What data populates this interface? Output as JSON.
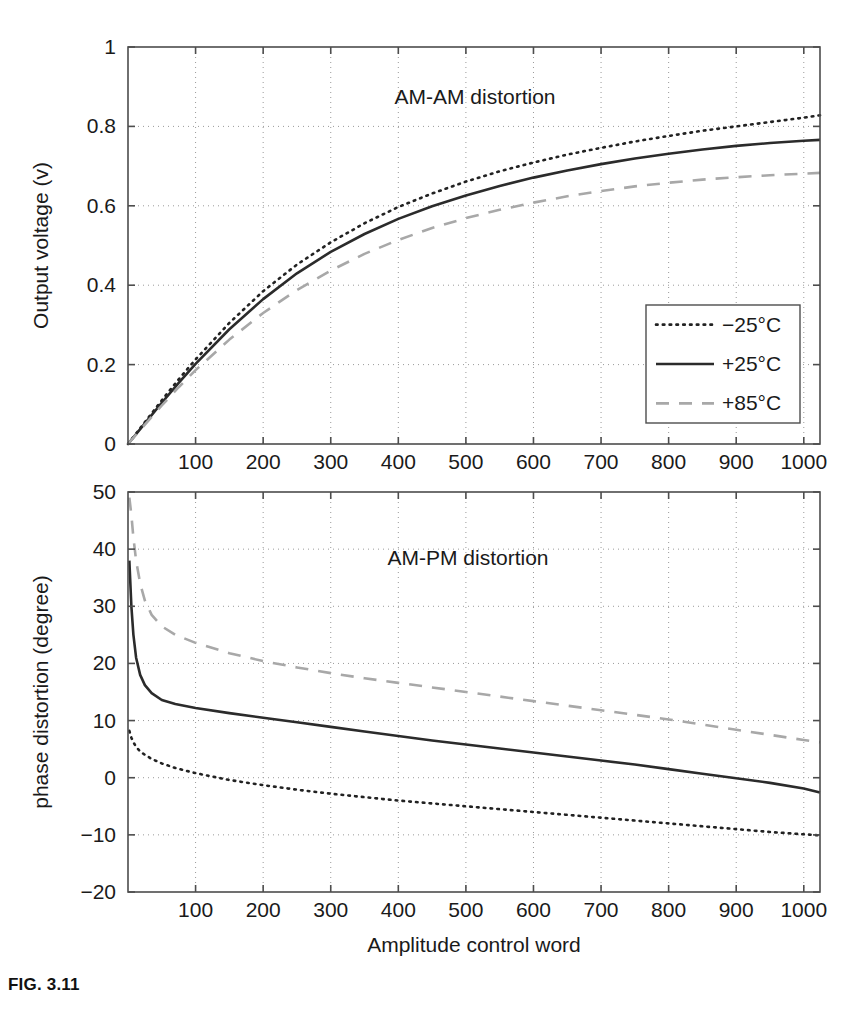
{
  "figure": {
    "caption": "FIG. 3.11",
    "width": 863,
    "height": 1019
  },
  "legend": {
    "entries": [
      {
        "label": "−25°C",
        "style": "dotted",
        "color": "#222222"
      },
      {
        "label": "+25°C",
        "style": "solid",
        "color": "#2b2b2b"
      },
      {
        "label": "+85°C",
        "style": "dashed",
        "color": "#a8a8a8"
      }
    ]
  },
  "chart_data": [
    {
      "id": "am-am",
      "type": "line",
      "title": "AM-AM distortion",
      "xlabel": "",
      "ylabel": "Output voltage (v)",
      "xlim": [
        0,
        1024
      ],
      "ylim": [
        0,
        1
      ],
      "xticks": [
        100,
        200,
        300,
        400,
        500,
        600,
        700,
        800,
        900,
        1000
      ],
      "yticks": [
        0,
        0.2,
        0.4,
        0.6,
        0.8,
        1
      ],
      "ytick_labels": [
        "0",
        "0.2",
        "0.4",
        "0.6",
        "0.8",
        "1"
      ],
      "xtick_labels": [
        "100",
        "200",
        "300",
        "400",
        "500",
        "600",
        "700",
        "800",
        "900",
        "1000"
      ],
      "grid": true,
      "legend_position": "lower-right",
      "x": [
        0,
        25,
        50,
        75,
        100,
        150,
        200,
        250,
        300,
        350,
        400,
        450,
        500,
        550,
        600,
        650,
        700,
        750,
        800,
        850,
        900,
        950,
        1000,
        1024
      ],
      "series": [
        {
          "name": "−25°C",
          "style": "dotted",
          "color": "#222222",
          "values": [
            0,
            0.055,
            0.11,
            0.163,
            0.213,
            0.305,
            0.385,
            0.452,
            0.508,
            0.556,
            0.597,
            0.631,
            0.661,
            0.687,
            0.709,
            0.729,
            0.746,
            0.762,
            0.776,
            0.789,
            0.8,
            0.811,
            0.822,
            0.828
          ]
        },
        {
          "name": "+25°C",
          "style": "solid",
          "color": "#2b2b2b",
          "values": [
            0,
            0.052,
            0.104,
            0.154,
            0.202,
            0.289,
            0.365,
            0.43,
            0.484,
            0.529,
            0.567,
            0.599,
            0.626,
            0.65,
            0.671,
            0.689,
            0.705,
            0.719,
            0.731,
            0.742,
            0.751,
            0.758,
            0.764,
            0.766
          ]
        },
        {
          "name": "+85°C",
          "style": "dashed",
          "color": "#a8a8a8",
          "values": [
            0,
            0.049,
            0.097,
            0.143,
            0.186,
            0.263,
            0.33,
            0.388,
            0.437,
            0.479,
            0.514,
            0.544,
            0.569,
            0.59,
            0.608,
            0.624,
            0.637,
            0.649,
            0.658,
            0.666,
            0.672,
            0.677,
            0.681,
            0.683
          ]
        }
      ]
    },
    {
      "id": "am-pm",
      "type": "line",
      "title": "AM-PM distortion",
      "xlabel": "Amplitude control word",
      "ylabel": "phase distortion (degree)",
      "xlim": [
        0,
        1024
      ],
      "ylim": [
        -20,
        50
      ],
      "xticks": [
        100,
        200,
        300,
        400,
        500,
        600,
        700,
        800,
        900,
        1000
      ],
      "yticks": [
        -20,
        -10,
        0,
        10,
        20,
        30,
        40,
        50
      ],
      "ytick_labels": [
        "−20",
        "−10",
        "0",
        "10",
        "20",
        "30",
        "40",
        "50"
      ],
      "xtick_labels": [
        "100",
        "200",
        "300",
        "400",
        "500",
        "600",
        "700",
        "800",
        "900",
        "1000"
      ],
      "grid": true,
      "x": [
        2,
        5,
        8,
        12,
        18,
        25,
        35,
        50,
        70,
        100,
        150,
        200,
        250,
        300,
        350,
        400,
        450,
        500,
        550,
        600,
        650,
        700,
        750,
        800,
        850,
        900,
        950,
        1000,
        1024
      ],
      "series": [
        {
          "name": "−25°C",
          "style": "dotted",
          "color": "#222222",
          "values": [
            8.2,
            7.0,
            6.2,
            5.4,
            4.6,
            4.0,
            3.3,
            2.5,
            1.7,
            0.8,
            -0.4,
            -1.3,
            -2.1,
            -2.8,
            -3.4,
            -4.0,
            -4.5,
            -5.0,
            -5.5,
            -6.0,
            -6.5,
            -7.0,
            -7.5,
            -8.0,
            -8.5,
            -9.0,
            -9.5,
            -9.9,
            -10.1
          ]
        },
        {
          "name": "+25°C",
          "style": "solid",
          "color": "#2b2b2b",
          "values": [
            38.0,
            30.0,
            25.0,
            21.0,
            18.0,
            16.2,
            14.8,
            13.6,
            12.9,
            12.2,
            11.3,
            10.5,
            9.7,
            8.9,
            8.1,
            7.3,
            6.5,
            5.8,
            5.1,
            4.4,
            3.7,
            3.0,
            2.3,
            1.5,
            0.7,
            -0.1,
            -0.9,
            -1.9,
            -2.6
          ]
        },
        {
          "name": "+85°C",
          "style": "dashed",
          "color": "#a8a8a8",
          "values": [
            49.0,
            46.0,
            42.0,
            38.0,
            34.0,
            31.0,
            28.5,
            26.5,
            25.0,
            23.6,
            21.8,
            20.4,
            19.3,
            18.3,
            17.4,
            16.6,
            15.8,
            15.0,
            14.2,
            13.4,
            12.6,
            11.8,
            11.0,
            10.2,
            9.3,
            8.4,
            7.5,
            6.6,
            6.2
          ]
        }
      ]
    }
  ],
  "geometry": {
    "panel_top": {
      "left": 128,
      "right": 820,
      "top": 47,
      "bottom": 444
    },
    "panel_bottom": {
      "left": 128,
      "right": 820,
      "top": 492,
      "bottom": 892
    },
    "legend_box": {
      "left": 646,
      "top": 305,
      "right": 800,
      "bottom": 423
    }
  }
}
